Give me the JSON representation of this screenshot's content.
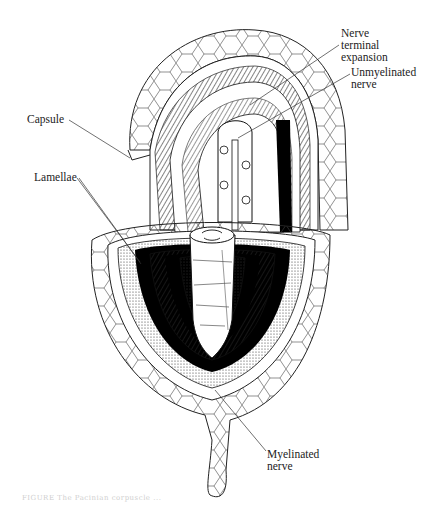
{
  "figure": {
    "labels": [
      {
        "id": "nerve-terminal-expansion",
        "text": "Nerve\nterminal\nexpansion",
        "x": 341,
        "y": 27
      },
      {
        "id": "unmyelinated-nerve",
        "text": "Unmyelinated\nnerve",
        "x": 351,
        "y": 66
      },
      {
        "id": "capsule",
        "text": "Capsule",
        "x": 27,
        "y": 113
      },
      {
        "id": "lamellae",
        "text": "Lamellae",
        "x": 34,
        "y": 171
      },
      {
        "id": "myelinated-nerve",
        "text": "Myelinated\nnerve",
        "x": 267,
        "y": 448
      }
    ],
    "caption": "FIGURE  The Pacinian corpuscle ..."
  },
  "colors": {
    "ink": "#111111",
    "paper": "#ffffff",
    "label_text": "#222222",
    "caption_text": "#cfcfcf"
  }
}
